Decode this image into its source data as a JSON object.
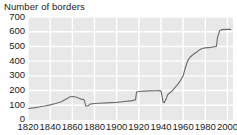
{
  "chart_data": {
    "type": "line",
    "title": "Number of borders",
    "xlabel": "",
    "ylabel": "",
    "xlim": [
      1820,
      2005
    ],
    "ylim": [
      0,
      700
    ],
    "xticks": [
      1820,
      1840,
      1860,
      1880,
      1900,
      1920,
      1940,
      1960,
      1980,
      2000
    ],
    "yticks": [
      0,
      100,
      200,
      300,
      400,
      500,
      600,
      700
    ],
    "grid": true,
    "legend": "none",
    "series": [
      {
        "name": "Number of borders",
        "line_color": "#6e6e6e",
        "x": [
          1820,
          1825,
          1830,
          1835,
          1840,
          1845,
          1850,
          1855,
          1858,
          1861,
          1864,
          1866,
          1868,
          1870,
          1871,
          1872,
          1874,
          1876,
          1880,
          1885,
          1890,
          1895,
          1900,
          1905,
          1910,
          1914,
          1916,
          1917,
          1918,
          1920,
          1925,
          1930,
          1935,
          1938,
          1939,
          1940,
          1941,
          1942,
          1943,
          1945,
          1946,
          1948,
          1950,
          1952,
          1955,
          1957,
          1960,
          1962,
          1964,
          1966,
          1968,
          1970,
          1972,
          1975,
          1977,
          1980,
          1985,
          1988,
          1990,
          1991,
          1993,
          1995,
          2000,
          2003
        ],
        "y": [
          78,
          82,
          88,
          95,
          103,
          112,
          124,
          145,
          158,
          160,
          155,
          148,
          142,
          140,
          132,
          96,
          95,
          108,
          112,
          114,
          116,
          118,
          120,
          124,
          128,
          132,
          135,
          137,
          190,
          194,
          196,
          198,
          199,
          200,
          198,
          196,
          160,
          120,
          118,
          150,
          172,
          185,
          196,
          215,
          240,
          262,
          300,
          355,
          400,
          425,
          438,
          450,
          460,
          478,
          486,
          490,
          494,
          498,
          500,
          560,
          608,
          614,
          616,
          616
        ]
      }
    ]
  },
  "axis": {
    "y_tick_labels": [
      "700",
      "600",
      "500",
      "400",
      "300",
      "200",
      "100",
      "0"
    ],
    "x_tick_labels": [
      "1820",
      "1840",
      "1860",
      "1880",
      "1900",
      "1920",
      "1940",
      "1960",
      "1980",
      "2000"
    ]
  },
  "style": {
    "plot_background": "#e8e8e8",
    "gridline_color": "#ffffff",
    "line_color": "#6e6e6e",
    "text_color": "#1a1a1a"
  }
}
